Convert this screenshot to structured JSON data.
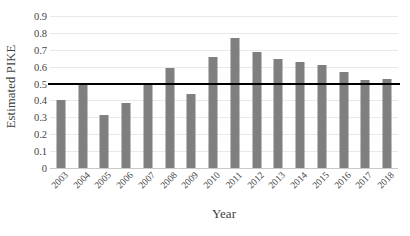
{
  "chart_data": {
    "type": "bar",
    "title": "",
    "xlabel": "Year",
    "ylabel": "Estimated PIKE",
    "categories": [
      "2003",
      "2004",
      "2005",
      "2006",
      "2007",
      "2008",
      "2009",
      "2010",
      "2011",
      "2012",
      "2013",
      "2014",
      "2015",
      "2016",
      "2017",
      "2018"
    ],
    "values": [
      0.405,
      0.495,
      0.315,
      0.385,
      0.5,
      0.59,
      0.44,
      0.655,
      0.77,
      0.685,
      0.645,
      0.63,
      0.61,
      0.57,
      0.52,
      0.53
    ],
    "series": [
      {
        "name": "Estimated PIKE",
        "values": [
          0.405,
          0.495,
          0.315,
          0.385,
          0.5,
          0.59,
          0.44,
          0.655,
          0.77,
          0.685,
          0.645,
          0.63,
          0.61,
          0.57,
          0.52,
          0.53
        ]
      }
    ],
    "ylim": [
      0,
      0.9
    ],
    "yticks": [
      0,
      0.1,
      0.2,
      0.3,
      0.4,
      0.5,
      0.6,
      0.7,
      0.8,
      0.9
    ],
    "ytick_labels": [
      "0",
      "0.1",
      "0.2",
      "0.3",
      "0.4",
      "0.5",
      "0.6",
      "0.7",
      "0.8",
      "0.9"
    ],
    "grid": true,
    "grid_axis": "y",
    "legend": false,
    "legend_position": "none",
    "bar_color": "#7f7f7f",
    "gridline_color": "#e9e9e9",
    "background_color": "#ffffff",
    "annotations": [
      {
        "name": "pike-threshold-line",
        "type": "hline",
        "value": 0.5,
        "color": "#000000",
        "width_px": 2,
        "label": ""
      }
    ],
    "xtick_rotation": -45
  }
}
